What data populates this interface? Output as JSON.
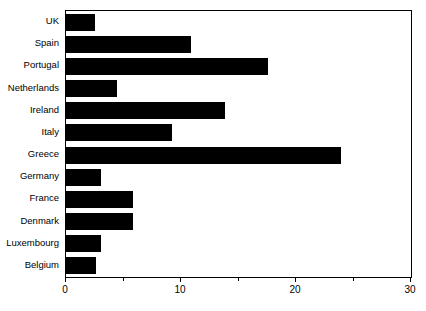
{
  "chart_data": {
    "type": "bar",
    "orientation": "horizontal",
    "title": "",
    "xlabel": "",
    "ylabel": "",
    "xlim": [
      0,
      30
    ],
    "grid": false,
    "legend": "none",
    "bar_color": "#000000",
    "background_color": "#ffffff",
    "axis_color": "#000000",
    "categories": [
      "UK",
      "Spain",
      "Portugal",
      "Netherlands",
      "Ireland",
      "Italy",
      "Greece",
      "Germany",
      "France",
      "Denmark",
      "Luxembourg",
      "Belgium"
    ],
    "values": [
      2.5,
      10.9,
      17.6,
      4.4,
      13.8,
      9.2,
      23.9,
      3.0,
      5.8,
      5.8,
      3.0,
      2.6
    ],
    "x_ticks_major": [
      0,
      10,
      20,
      30
    ],
    "x_tick_labels": [
      "0",
      "10",
      "20",
      "30"
    ],
    "x_ticks_minor": [
      5,
      15,
      25
    ]
  }
}
